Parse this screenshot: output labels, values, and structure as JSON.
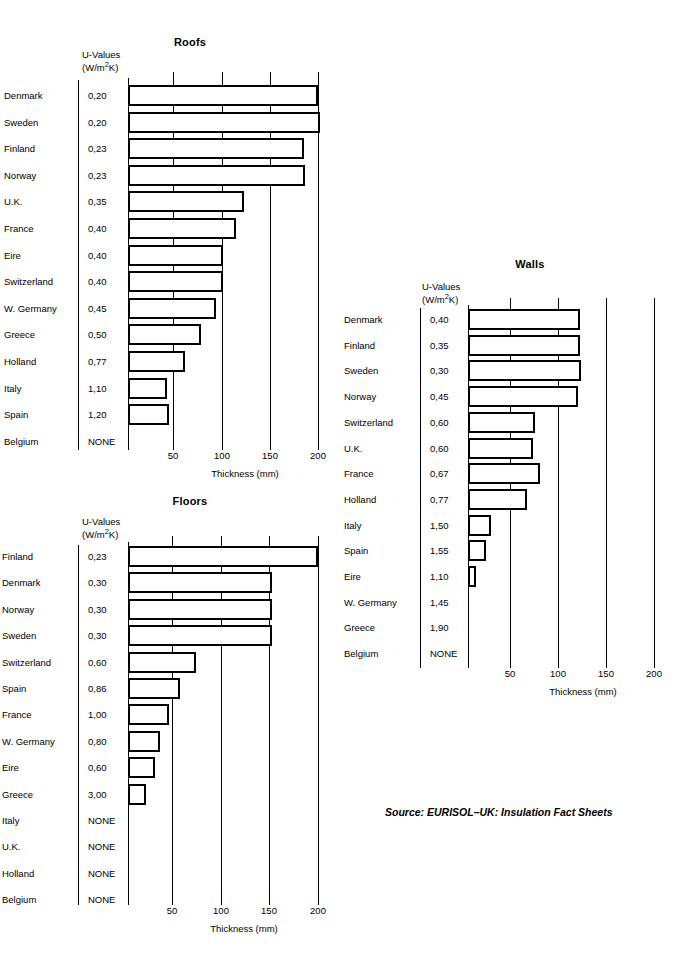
{
  "source_note": "Source: EURISOL–UK: Insulation Fact Sheets",
  "uvalue_header_line1": "U-Values",
  "uvalue_header_line2_pre": "(W/m",
  "uvalue_header_sup": "2",
  "uvalue_header_line2_post": "K)",
  "axis_title": "Thickness (mm)",
  "tick_labels": [
    "50",
    "100",
    "150",
    "200"
  ],
  "chart_data": [
    {
      "type": "bar",
      "title": "Roofs",
      "orientation": "horizontal",
      "xlabel": "Thickness (mm)",
      "ylabel": "",
      "xlim": [
        0,
        210
      ],
      "ticks": [
        50,
        100,
        150,
        200
      ],
      "grid": true,
      "legend": "none",
      "value_column_header": "U-Values (W/m2K)",
      "categories": [
        "Denmark",
        "Sweden",
        "Finland",
        "Norway",
        "U.K.",
        "France",
        "Eire",
        "Switzerland",
        "W. Germany",
        "Greece",
        "Holland",
        "Italy",
        "Spain",
        "Belgium"
      ],
      "u_values": [
        "0,20",
        "0,20",
        "0,23",
        "0,23",
        "0,35",
        "0,40",
        "0,40",
        "0,40",
        "0,45",
        "0,50",
        "0,77",
        "1,10",
        "1,20",
        "NONE"
      ],
      "values": [
        200,
        202,
        185,
        186,
        122,
        113,
        100,
        100,
        92,
        77,
        60,
        41,
        43,
        0
      ]
    },
    {
      "type": "bar",
      "title": "Walls",
      "orientation": "horizontal",
      "xlabel": "Thickness (mm)",
      "ylabel": "",
      "xlim": [
        0,
        210
      ],
      "ticks": [
        50,
        100,
        150,
        200
      ],
      "grid": true,
      "legend": "none",
      "value_column_header": "U-Values (W/m2K)",
      "categories": [
        "Denmark",
        "Finland",
        "Sweden",
        "Norway",
        "Switzerland",
        "U.K.",
        "France",
        "Holland",
        "Italy",
        "Spain",
        "Eire",
        "W. Germany",
        "Greece",
        "Belgium"
      ],
      "u_values": [
        "0,40",
        "0,35",
        "0,30",
        "0,45",
        "0,60",
        "0,60",
        "0,67",
        "0,77",
        "1,50",
        "1,55",
        "1,10",
        "1,45",
        "1,90",
        "NONE"
      ],
      "values": [
        120,
        120,
        121,
        118,
        72,
        70,
        77,
        63,
        25,
        19,
        9,
        0,
        0,
        0
      ]
    },
    {
      "type": "bar",
      "title": "Floors",
      "orientation": "horizontal",
      "xlabel": "Thickness (mm)",
      "ylabel": "",
      "xlim": [
        0,
        210
      ],
      "ticks": [
        50,
        100,
        150,
        200
      ],
      "grid": true,
      "legend": "none",
      "value_column_header": "U-Values (W/m2K)",
      "categories": [
        "Finland",
        "Denmark",
        "Norway",
        "Sweden",
        "Switzerland",
        "Spain",
        "France",
        "W. Germany",
        "Eire",
        "Greece",
        "Italy",
        "U.K.",
        "Holland",
        "Belgium"
      ],
      "u_values": [
        "0,23",
        "0,30",
        "0,30",
        "0,30",
        "0,60",
        "0,86",
        "1,00",
        "0,80",
        "0,60",
        "3,00",
        "NONE",
        "NONE",
        "NONE",
        "NONE"
      ],
      "values": [
        200,
        152,
        152,
        152,
        72,
        55,
        43,
        34,
        28,
        19,
        0,
        0,
        0,
        0
      ]
    }
  ]
}
